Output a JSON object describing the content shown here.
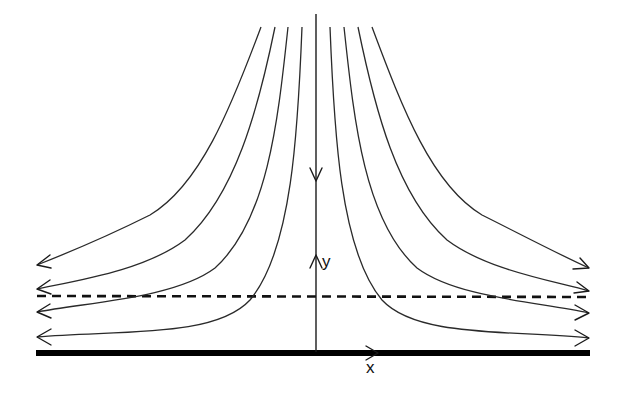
{
  "figure": {
    "labels": {
      "x_axis": "x",
      "y_axis": "y"
    },
    "elements": {
      "wall": "thick solid line along x-axis",
      "reference_line": "dashed horizontal line (boundary layer edge)",
      "symmetry_axis": "vertical line with downward flow arrow and upward y-axis arrow",
      "streamlines_per_side": 4
    },
    "colors": {
      "line": "#2a2a2a",
      "wall": "#000000",
      "background": "#ffffff"
    }
  }
}
